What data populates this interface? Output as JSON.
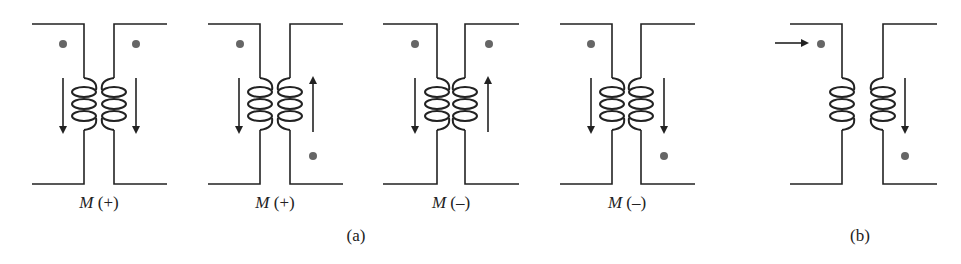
{
  "figure": {
    "panels": [
      {
        "id": "a1",
        "label_symbol": "M",
        "label_sign": "(+)",
        "dots": [
          "top-left",
          "top-right"
        ],
        "arrows": {
          "primary": "down",
          "secondary": "down"
        }
      },
      {
        "id": "a2",
        "label_symbol": "M",
        "label_sign": "(+)",
        "dots": [
          "top-left",
          "bottom-right"
        ],
        "arrows": {
          "primary": "down",
          "secondary": "up"
        }
      },
      {
        "id": "a3",
        "label_symbol": "M",
        "label_sign": "(–)",
        "dots": [
          "top-left",
          "top-right"
        ],
        "arrows": {
          "primary": "down",
          "secondary": "up"
        }
      },
      {
        "id": "a4",
        "label_symbol": "M",
        "label_sign": "(–)",
        "dots": [
          "top-left",
          "bottom-right"
        ],
        "arrows": {
          "primary": "down",
          "secondary": "down"
        }
      },
      {
        "id": "b",
        "dots": [
          "top-left",
          "bottom-right"
        ],
        "arrows": {
          "input": "right",
          "secondary": "down"
        }
      }
    ],
    "group_labels": {
      "a": "(a)",
      "b": "(b)"
    },
    "colors": {
      "line": "#222222",
      "dot": "#666666"
    }
  }
}
